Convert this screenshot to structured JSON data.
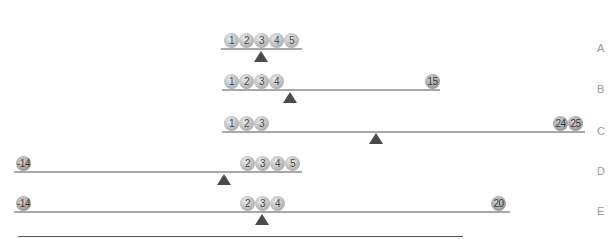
{
  "rows": [
    {
      "label": "A",
      "beam": {
        "x": 221,
        "y": 48,
        "w": 81
      },
      "fulcrum_x": 254,
      "fulcrum_y": 51,
      "balls": [
        {
          "v": "1",
          "x": 224
        },
        {
          "v": "2",
          "x": 239
        },
        {
          "v": "3",
          "x": 254
        },
        {
          "v": "4",
          "x": 269
        },
        {
          "v": "5",
          "x": 284
        }
      ]
    },
    {
      "label": "B",
      "beam": {
        "x": 222,
        "y": 89,
        "w": 218
      },
      "fulcrum_x": 283,
      "fulcrum_y": 92,
      "balls": [
        {
          "v": "1",
          "x": 224
        },
        {
          "v": "2",
          "x": 239
        },
        {
          "v": "3",
          "x": 254
        },
        {
          "v": "4",
          "x": 269
        },
        {
          "v": "15",
          "x": 425,
          "dark": true
        }
      ]
    },
    {
      "label": "C",
      "beam": {
        "x": 222,
        "y": 131,
        "w": 363
      },
      "fulcrum_x": 369,
      "fulcrum_y": 133,
      "balls": [
        {
          "v": "1",
          "x": 224
        },
        {
          "v": "2",
          "x": 239
        },
        {
          "v": "3",
          "x": 254
        },
        {
          "v": "24",
          "x": 553,
          "dark": true
        },
        {
          "v": "25",
          "x": 568,
          "dark": true
        }
      ]
    },
    {
      "label": "D",
      "beam": {
        "x": 14,
        "y": 171,
        "w": 288
      },
      "fulcrum_x": 217,
      "fulcrum_y": 174,
      "balls": [
        {
          "v": "-14",
          "x": 16,
          "dark": true
        },
        {
          "v": "2",
          "x": 240
        },
        {
          "v": "3",
          "x": 255
        },
        {
          "v": "4",
          "x": 270
        },
        {
          "v": "5",
          "x": 285
        }
      ]
    },
    {
      "label": "E",
      "beam": {
        "x": 14,
        "y": 211,
        "w": 496
      },
      "fulcrum_x": 255,
      "fulcrum_y": 214,
      "balls": [
        {
          "v": "-14",
          "x": 16,
          "dark": true
        },
        {
          "v": "2",
          "x": 240
        },
        {
          "v": "3",
          "x": 255
        },
        {
          "v": "4",
          "x": 270
        },
        {
          "v": "20",
          "x": 491,
          "dark": true
        }
      ]
    }
  ],
  "colors": {
    "beam": "#a8a8a8",
    "fulcrum": "#4a4a4a",
    "label": "#9a9a9a",
    "baseline": "#555555"
  }
}
